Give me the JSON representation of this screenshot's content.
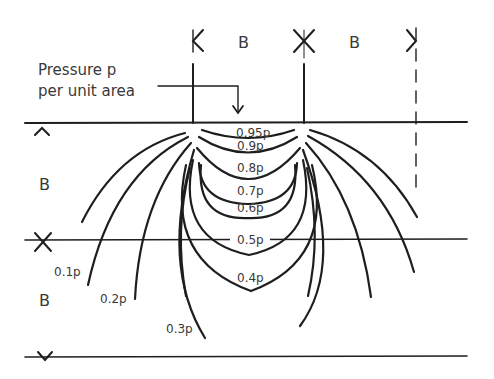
{
  "diagram": {
    "title_line1": "Pressure p",
    "title_line2": "per unit area",
    "dimension_labels": {
      "top_left_width": "B",
      "top_right_width": "B",
      "left_upper_depth": "B",
      "left_lower_depth": "B"
    },
    "isobars": [
      {
        "label": "0.95p",
        "value": 0.95
      },
      {
        "label": "0.9p",
        "value": 0.9
      },
      {
        "label": "0.8p",
        "value": 0.8
      },
      {
        "label": "0.7p",
        "value": 0.7
      },
      {
        "label": "0.6p",
        "value": 0.6
      },
      {
        "label": "0.5p",
        "value": 0.5
      },
      {
        "label": "0.4p",
        "value": 0.4
      },
      {
        "label": "0.3p",
        "value": 0.3
      },
      {
        "label": "0.2p",
        "value": 0.2
      },
      {
        "label": "0.1p",
        "value": 0.1
      }
    ],
    "line_color": "#1e1e1e",
    "text_color": "#3a3a3a"
  }
}
